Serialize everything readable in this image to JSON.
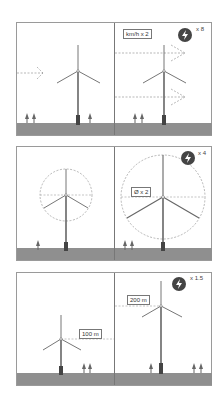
{
  "caption": "",
  "panels": [
    {
      "name": "wind-speed",
      "label": "km/h x 2",
      "multiplier": "x 8"
    },
    {
      "name": "rotor-diameter",
      "label": "Ø x 2",
      "multiplier": "x 4"
    },
    {
      "name": "hub-height",
      "label_left": "100 m",
      "label_right": "200 m",
      "multiplier": "x 1.5"
    }
  ],
  "colors": {
    "badge": "#444444",
    "ground": "#8f8f8f",
    "line": "#555555"
  },
  "icons": [
    "lightning-bolt-icon",
    "wind-turbine-icon",
    "tree-icon",
    "dashed-arrow-icon"
  ]
}
